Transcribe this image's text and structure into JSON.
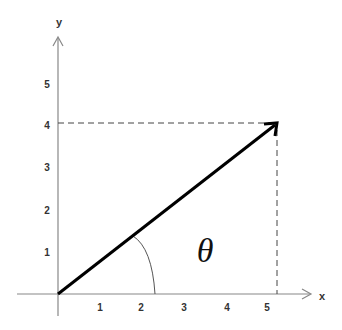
{
  "diagram": {
    "title": "",
    "axes": {
      "x_label": "x",
      "y_label": "y",
      "x_ticks": [
        "1",
        "2",
        "3",
        "4",
        "5"
      ],
      "y_ticks": [
        "1",
        "2",
        "3",
        "4",
        "5"
      ]
    },
    "vector": {
      "from": [
        0,
        0
      ],
      "to": [
        5.2,
        4
      ],
      "angle_label": "θ"
    },
    "projections": {
      "horizontal_at_y": "4",
      "vertical_at_x": "~5.2"
    },
    "colors": {
      "axis": "#888888",
      "vector": "#000000",
      "dashed": "#444444",
      "arc": "#555555",
      "text": "#333333"
    }
  }
}
